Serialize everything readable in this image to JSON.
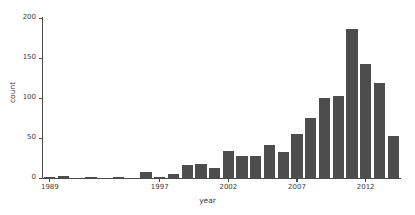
{
  "chart_data": {
    "type": "bar",
    "title": "",
    "xlabel": "year",
    "ylabel": "count",
    "categories": [
      "1989",
      "1990",
      "1991",
      "1992",
      "1993",
      "1994",
      "1995",
      "1996",
      "1997",
      "1998",
      "1999",
      "2000",
      "2001",
      "2002",
      "2003",
      "2004",
      "2005",
      "2006",
      "2007",
      "2008",
      "2009",
      "2010",
      "2011",
      "2012",
      "2013",
      "2014"
    ],
    "values": [
      1,
      2,
      0,
      1,
      0,
      1,
      0,
      7,
      1,
      5,
      16,
      17,
      13,
      34,
      27,
      28,
      41,
      32,
      55,
      75,
      100,
      103,
      186,
      142,
      119,
      53
    ],
    "xlim": [
      1988.5,
      2014.5
    ],
    "ylim": [
      0,
      200
    ],
    "x_tick_labels": [
      "1989",
      "1997",
      "2002",
      "2007",
      "2012"
    ],
    "x_tick_values": [
      1989,
      1997,
      2002,
      2007,
      2012
    ],
    "y_tick_labels": [
      "0",
      "50",
      "100",
      "150",
      "200"
    ],
    "y_tick_values": [
      0,
      50,
      100,
      150,
      200
    ],
    "grid": false,
    "legend": null,
    "bar_color": "#4d4d4d",
    "axis_color": "#4a4a4a",
    "background_color": "#ffffff"
  }
}
